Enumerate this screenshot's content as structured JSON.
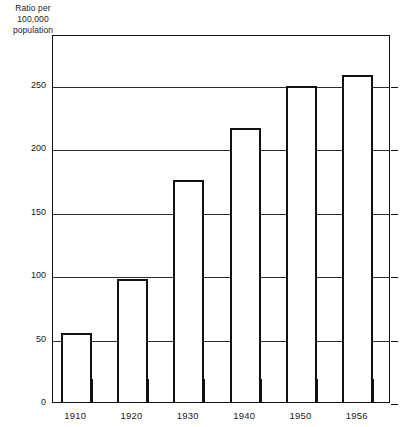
{
  "chart_data": {
    "type": "bar",
    "title": "",
    "subtitle": "",
    "xlabel": "",
    "ylabel": "Ratio per 100,000 population",
    "ylabel_lines": [
      "Ratio per",
      "100,000",
      "population"
    ],
    "categories": [
      "1910",
      "1920",
      "1930",
      "1940",
      "1950",
      "1956"
    ],
    "values": [
      54,
      97,
      175,
      216,
      249,
      258
    ],
    "series": [
      {
        "name": "Ratio per 100,000 population",
        "values": [
          54,
          97,
          175,
          216,
          249,
          258
        ]
      }
    ],
    "ylim": [
      0,
      290
    ],
    "ytick_labels": [
      "0",
      "50",
      "100",
      "150",
      "200",
      "250"
    ],
    "ytick_values": [
      0,
      50,
      100,
      150,
      200,
      250
    ],
    "grid": true,
    "grid_axis": "y",
    "legend": false,
    "legend_position": "none",
    "bar_fill_color": "#ffffff",
    "bar_edge_color": "#111111",
    "axis_color": "#111111",
    "grid_color": "#2b2b2b",
    "background_color": "#ffffff",
    "annotations": []
  }
}
